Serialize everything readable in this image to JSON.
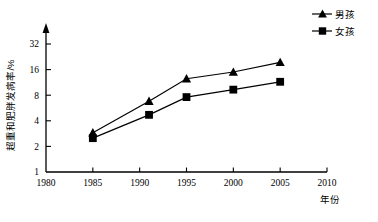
{
  "chart_data": {
    "type": "line",
    "title": "",
    "xlabel": "年份",
    "ylabel": "超重和肥胖发病率/%",
    "x": [
      1985,
      1991,
      1995,
      2000,
      2005
    ],
    "xlim": [
      1980,
      2010
    ],
    "ylim": [
      1,
      40
    ],
    "yscale": "log2",
    "grid": false,
    "legend_position": "top-right",
    "xticks": [
      "1980",
      "1985",
      "1990",
      "1995",
      "2000",
      "2005",
      "2010"
    ],
    "xtick_values": [
      1980,
      1985,
      1990,
      1995,
      2000,
      2005,
      2010
    ],
    "yticks": [
      "1",
      "2",
      "4",
      "8",
      "16",
      "32"
    ],
    "ytick_values": [
      1,
      2,
      4,
      8,
      16,
      32
    ],
    "series": [
      {
        "name": "男孩",
        "marker": "triangle",
        "color": "#000000",
        "values": [
          2.9,
          6.8,
          12.5,
          15.0,
          19.5
        ]
      },
      {
        "name": "女孩",
        "marker": "square",
        "color": "#000000",
        "values": [
          2.5,
          4.7,
          7.6,
          9.3,
          11.5
        ]
      }
    ]
  },
  "legend": {
    "items": [
      {
        "label": "男孩",
        "marker": "triangle"
      },
      {
        "label": "女孩",
        "marker": "square"
      }
    ]
  },
  "axes": {
    "y_title": "超重和肥胖发病率/%",
    "x_title": "年份"
  }
}
